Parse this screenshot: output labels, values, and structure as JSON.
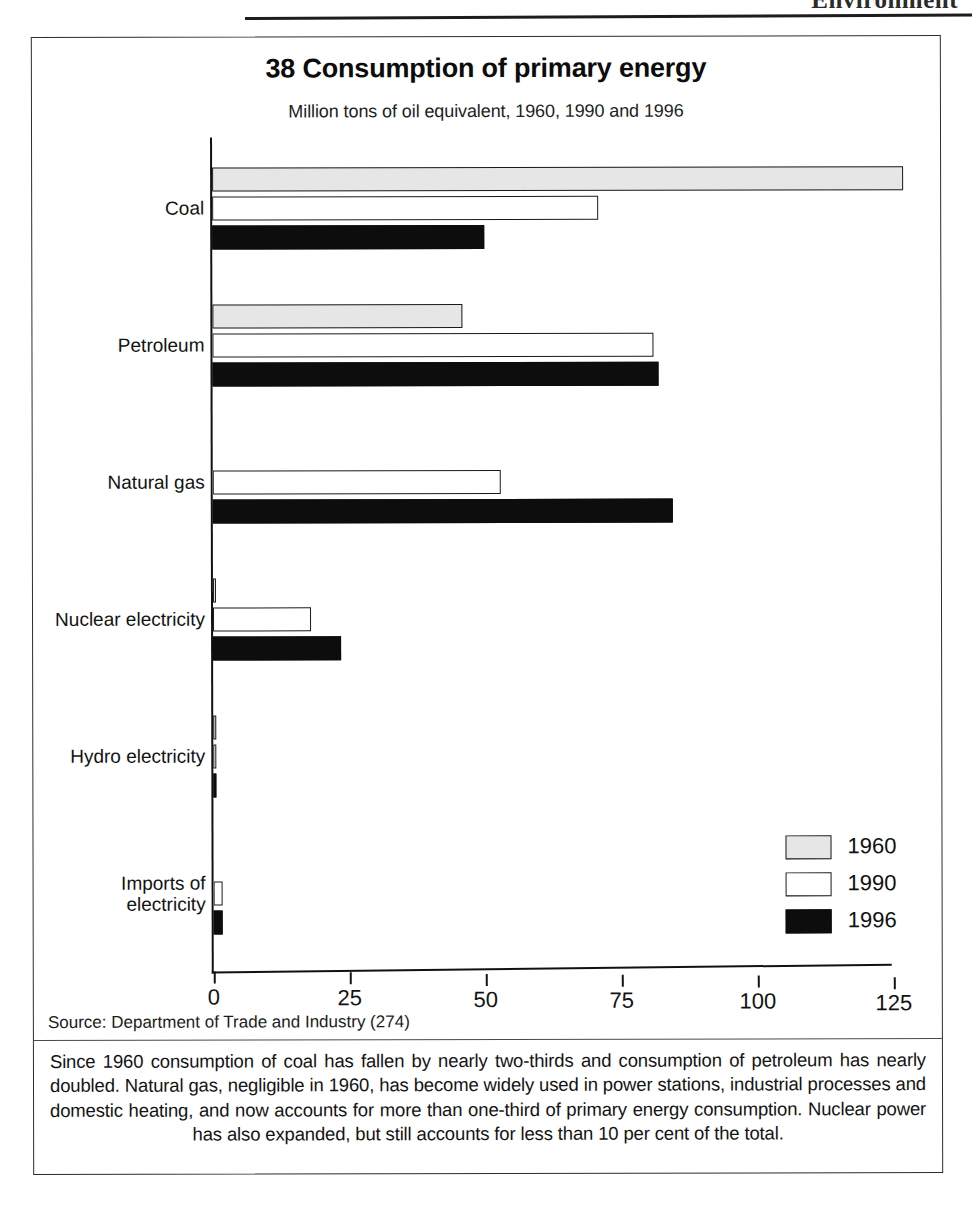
{
  "page": {
    "running_head": "Environment"
  },
  "chart_data": {
    "type": "bar",
    "orientation": "horizontal",
    "title": "38 Consumption of primary energy",
    "subtitle": "Million tons of oil equivalent, 1960, 1990 and 1996",
    "xlabel": "",
    "ylabel": "",
    "xlim": [
      0,
      125
    ],
    "xticks": [
      0,
      25,
      50,
      75,
      100,
      125
    ],
    "xtick_labels": [
      "0",
      "25",
      "50",
      "75",
      "100",
      "125"
    ],
    "grid": false,
    "legend_position": "bottom-right",
    "categories": [
      "Coal",
      "Petroleum",
      "Natural gas",
      "Nuclear electricity",
      "Hydro electricity",
      "Imports of\nelectricity"
    ],
    "series": [
      {
        "name": "1960",
        "color": "#e6e6e6",
        "values": [
          127,
          46,
          0,
          0.5,
          0.6,
          0
        ]
      },
      {
        "name": "1990",
        "color": "#ffffff",
        "values": [
          71,
          81,
          53,
          18,
          0.5,
          1.7
        ]
      },
      {
        "name": "1996",
        "color": "#0d0d0d",
        "values": [
          50,
          82,
          84.5,
          23.5,
          0.5,
          1.7
        ]
      }
    ]
  },
  "legend": {
    "items": [
      {
        "label": "1960",
        "swatch": "y1960"
      },
      {
        "label": "1990",
        "swatch": "y1990"
      },
      {
        "label": "1996",
        "swatch": "y1996"
      }
    ]
  },
  "source": {
    "text": "Source: Department of Trade and Industry (274)"
  },
  "caption": {
    "text": "Since 1960 consumption of coal has fallen by nearly two-thirds and consumption of petroleum has nearly doubled. Natural gas, negligible in 1960, has become widely used in power stations, industrial processes and domestic heating, and now accounts for more than one-third of primary energy consumption. Nuclear power has also expanded, but still accounts for less than 10 per cent of the total."
  }
}
